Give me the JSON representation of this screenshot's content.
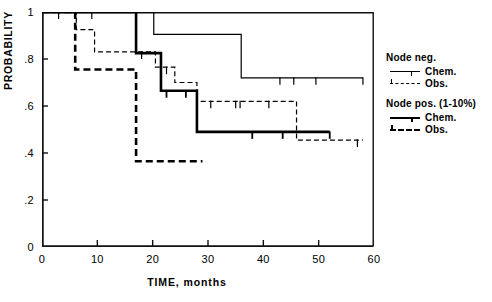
{
  "chart_data": {
    "type": "line",
    "title": "",
    "xlabel": "TIME, months",
    "ylabel": "PROBABILITY",
    "xlim": [
      0,
      60
    ],
    "ylim": [
      0,
      1
    ],
    "xticks": [
      0,
      10,
      20,
      30,
      40,
      50,
      60
    ],
    "xtick_labels": [
      "0",
      "10",
      "20",
      "30",
      "40",
      "50",
      "60"
    ],
    "yticks": [
      0,
      0.2,
      0.4,
      0.6,
      0.8,
      1
    ],
    "ytick_labels": [
      "0",
      ".2",
      ".4",
      ".6",
      ".8",
      "1"
    ],
    "grid": false,
    "legend_position": "right",
    "series": [
      {
        "name": "Node neg. Chem.",
        "group": "Node neg.",
        "treatment": "Chem.",
        "style": "thin-solid",
        "color": "#000000",
        "steps": [
          [
            0,
            1.0
          ],
          [
            20.2,
            1.0
          ],
          [
            20.2,
            0.905
          ],
          [
            36.0,
            0.905
          ],
          [
            36.0,
            0.72
          ],
          [
            58.0,
            0.72
          ]
        ],
        "censor_times": [
          3.0,
          6.0,
          9.0,
          43.0,
          45.5,
          49.5,
          58.0
        ]
      },
      {
        "name": "Node neg. Obs.",
        "group": "Node neg.",
        "treatment": "Obs.",
        "style": "thin-dashed",
        "color": "#000000",
        "steps": [
          [
            0,
            1.0
          ],
          [
            6.2,
            1.0
          ],
          [
            6.2,
            0.925
          ],
          [
            9.5,
            0.925
          ],
          [
            9.5,
            0.83
          ],
          [
            20.5,
            0.83
          ],
          [
            20.5,
            0.765
          ],
          [
            24.0,
            0.765
          ],
          [
            24.0,
            0.7
          ],
          [
            28.0,
            0.7
          ],
          [
            28.0,
            0.62
          ],
          [
            46.0,
            0.62
          ],
          [
            46.0,
            0.455
          ],
          [
            58.0,
            0.455
          ]
        ],
        "censor_times": [
          18.0,
          22.5,
          30.5,
          35.0,
          35.8,
          41.0,
          57.0
        ]
      },
      {
        "name": "Node pos. (1-10%) Chem.",
        "group": "Node pos. (1-10%)",
        "treatment": "Chem.",
        "style": "bold-solid",
        "color": "#000000",
        "steps": [
          [
            0,
            1.0
          ],
          [
            17.0,
            1.0
          ],
          [
            17.0,
            0.825
          ],
          [
            21.5,
            0.825
          ],
          [
            21.5,
            0.665
          ],
          [
            28.0,
            0.665
          ],
          [
            28.0,
            0.49
          ],
          [
            52.0,
            0.49
          ]
        ],
        "censor_times": [
          22.5,
          26.0,
          38.0,
          43.5,
          52.0
        ]
      },
      {
        "name": "Node pos. (1-10%) Obs.",
        "group": "Node pos. (1-10%)",
        "treatment": "Obs.",
        "style": "bold-dashed",
        "color": "#000000",
        "steps": [
          [
            0,
            1.0
          ],
          [
            6.0,
            1.0
          ],
          [
            6.0,
            0.755
          ],
          [
            17.0,
            0.755
          ],
          [
            17.0,
            0.365
          ],
          [
            29.0,
            0.365
          ]
        ],
        "censor_times": []
      }
    ]
  },
  "legend": {
    "groups": [
      {
        "heading": "Node neg.",
        "entries": [
          {
            "label": "Chem.",
            "style": "thin-solid"
          },
          {
            "label": "Obs.",
            "style": "thin-dashed"
          }
        ]
      },
      {
        "heading": "Node pos. (1-10%)",
        "entries": [
          {
            "label": "Chem.",
            "style": "bold-solid"
          },
          {
            "label": "Obs.",
            "style": "bold-dashed"
          }
        ]
      }
    ]
  }
}
